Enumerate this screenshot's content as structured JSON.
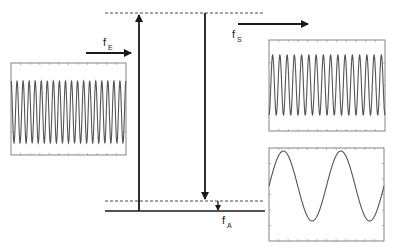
{
  "diagram": {
    "type": "energy-level / frequency mixing diagram",
    "labels": {
      "pump": {
        "main": "f",
        "sub": "E"
      },
      "signal": {
        "main": "f",
        "sub": "S"
      },
      "idler": {
        "main": "f",
        "sub": "A"
      }
    },
    "panels": [
      {
        "id": "input-waveform",
        "description": "high-frequency sinusoid",
        "cycles": 19
      },
      {
        "id": "output-waveform-high",
        "description": "high-frequency sinusoid",
        "cycles": 16
      },
      {
        "id": "output-waveform-low",
        "description": "low-frequency sinusoid",
        "cycles": 2
      }
    ],
    "levels": [
      "upper virtual level (dashed)",
      "lower virtual level (dashed)",
      "ground level (solid)"
    ],
    "colors": {
      "line": "#1a1a1a",
      "wave": "#555555",
      "frame": "#666666"
    }
  }
}
